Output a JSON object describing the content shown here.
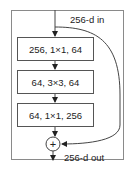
{
  "diagram": {
    "input_label": "256-d in",
    "output_label": "256-d out",
    "layers": [
      {
        "label": "256, 1×1, 64"
      },
      {
        "label": "64, 3×3, 64"
      },
      {
        "label": "64, 1×1, 256"
      }
    ],
    "add_symbol": "+",
    "colors": {
      "stroke": "#555555",
      "frame": "#8a8a8a",
      "text": "#222222"
    }
  }
}
